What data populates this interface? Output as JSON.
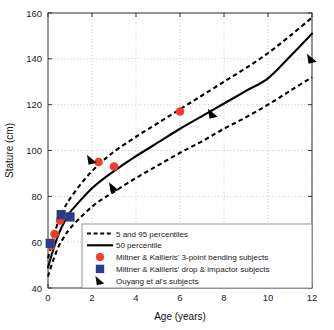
{
  "chart_data": {
    "type": "line",
    "title": "",
    "xlabel": "Age (years)",
    "ylabel": "Stature (cm)",
    "xlim": [
      0,
      12
    ],
    "ylim": [
      40,
      160
    ],
    "xticks": [
      "0",
      "2",
      "4",
      "6",
      "8",
      "10",
      "12"
    ],
    "yticks": [
      "40",
      "60",
      "80",
      "100",
      "120",
      "140",
      "160"
    ],
    "grid": true,
    "legend_position": "lower right",
    "series": [
      {
        "name": "5 and 95 percentiles",
        "style": "dashed",
        "color": "#000000",
        "sub_curves": [
          {
            "name": "95 percentile",
            "x": [
              0,
              0.25,
              0.5,
              0.75,
              1,
              1.5,
              2,
              2.5,
              3,
              4,
              5,
              6,
              7,
              8,
              9,
              10,
              11,
              12
            ],
            "y": [
              53,
              62,
              70,
              75,
              79,
              85.5,
              91,
              95.5,
              99.5,
              106,
              112,
              118,
              124,
              130,
              136,
              142.5,
              150,
              158
            ]
          },
          {
            "name": "5 percentile",
            "x": [
              0,
              0.25,
              0.5,
              0.75,
              1,
              1.5,
              2,
              2.5,
              3,
              4,
              5,
              6,
              7,
              8,
              9,
              10,
              11,
              12
            ],
            "y": [
              45,
              52.5,
              58.5,
              62.5,
              66,
              71,
              75.5,
              79,
              82,
              88,
              93.5,
              99,
              104,
              109.5,
              114.5,
              120,
              126,
              132
            ]
          }
        ]
      },
      {
        "name": "50 percentile",
        "style": "solid",
        "color": "#000000",
        "x": [
          0,
          0.25,
          0.5,
          0.75,
          1,
          1.5,
          2,
          2.5,
          3,
          4,
          5,
          6,
          7,
          8,
          9,
          10,
          11,
          12
        ],
        "y": [
          49,
          57,
          64,
          69,
          73,
          78.5,
          83.5,
          87.5,
          91,
          97.5,
          103.5,
          109.5,
          115,
          120.5,
          126,
          131.5,
          141,
          151
        ]
      }
    ],
    "scatter_series": [
      {
        "name": "Miltner & Kallieris' 3-point bending subjects",
        "marker": "circle",
        "color": "#F03C28",
        "points": [
          {
            "x": 0.15,
            "y": 58.5
          },
          {
            "x": 0.3,
            "y": 63.5
          },
          {
            "x": 0.55,
            "y": 69.5
          },
          {
            "x": 2.3,
            "y": 95
          },
          {
            "x": 3.0,
            "y": 93
          },
          {
            "x": 6.0,
            "y": 117
          }
        ]
      },
      {
        "name": "Miltner & Kallieris' drop & impactor subjects",
        "marker": "square",
        "color": "#2A3C8C",
        "points": [
          {
            "x": 0.1,
            "y": 59.5
          },
          {
            "x": 0.6,
            "y": 72
          },
          {
            "x": 1.0,
            "y": 71
          }
        ]
      },
      {
        "name": "Ouyang et al's subjects",
        "marker": "triangle",
        "color": "#000000",
        "points": [
          {
            "x": 2.0,
            "y": 96
          },
          {
            "x": 3.0,
            "y": 84
          },
          {
            "x": 7.5,
            "y": 116
          },
          {
            "x": 12.0,
            "y": 140
          }
        ]
      }
    ]
  },
  "legend": {
    "entries": [
      {
        "label": "5 and 95 percentiles",
        "marker": "dashed-line"
      },
      {
        "label": "50 percentile",
        "marker": "solid-line"
      },
      {
        "label": "Miltner & Kallieris' 3-point bending subjects",
        "marker": "red-circle"
      },
      {
        "label": "Miltner & Kallieris' drop & impactor subjects",
        "marker": "blue-square"
      },
      {
        "label": "Ouyang et al's subjects",
        "marker": "black-triangle"
      }
    ]
  },
  "colors": {
    "red": "#F03C28",
    "blue": "#2A3C8C",
    "black": "#000000",
    "grid": "#b9b9b9",
    "axis": "#333333"
  }
}
